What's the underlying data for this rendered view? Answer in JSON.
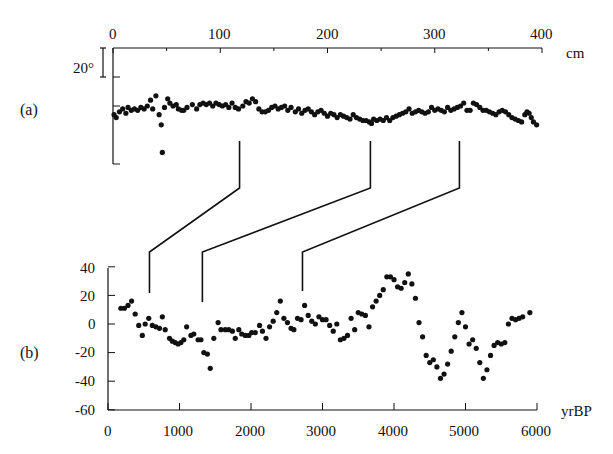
{
  "chart_data": [
    {
      "panel": "(a)",
      "type": "scatter",
      "title": "",
      "xlabel": "cm",
      "ylabel": "",
      "x_axis_position": "top",
      "xlim": [
        0,
        400
      ],
      "x_ticks": [
        0,
        100,
        200,
        300,
        400
      ],
      "scale_bar": "20°",
      "scale_bar_degrees": 20,
      "y_unit": "degrees (relative, unlabeled)",
      "grid": false,
      "points": [
        [
          1,
          -6
        ],
        [
          3,
          -8
        ],
        [
          6,
          -4
        ],
        [
          9,
          -2
        ],
        [
          12,
          -5
        ],
        [
          14,
          -1
        ],
        [
          17,
          -3
        ],
        [
          20,
          -2
        ],
        [
          23,
          -3
        ],
        [
          26,
          -1
        ],
        [
          29,
          -2
        ],
        [
          32,
          0
        ],
        [
          35,
          4
        ],
        [
          37,
          -2
        ],
        [
          40,
          7
        ],
        [
          43,
          -6
        ],
        [
          45,
          -13
        ],
        [
          46,
          -32
        ],
        [
          48,
          -1
        ],
        [
          51,
          5
        ],
        [
          53,
          2
        ],
        [
          56,
          0
        ],
        [
          59,
          1
        ],
        [
          61,
          -2
        ],
        [
          64,
          -3
        ],
        [
          66,
          -3
        ],
        [
          69,
          -1
        ],
        [
          74,
          1
        ],
        [
          78,
          -2
        ],
        [
          81,
          1
        ],
        [
          84,
          2
        ],
        [
          87,
          1
        ],
        [
          90,
          2
        ],
        [
          93,
          0
        ],
        [
          96,
          2
        ],
        [
          99,
          1
        ],
        [
          102,
          0
        ],
        [
          105,
          1
        ],
        [
          108,
          -1
        ],
        [
          111,
          2
        ],
        [
          114,
          -1
        ],
        [
          117,
          -2
        ],
        [
          121,
          0
        ],
        [
          124,
          3
        ],
        [
          127,
          2
        ],
        [
          130,
          5
        ],
        [
          133,
          3
        ],
        [
          136,
          -2
        ],
        [
          139,
          -4
        ],
        [
          142,
          -4
        ],
        [
          145,
          -3
        ],
        [
          148,
          -1
        ],
        [
          151,
          0
        ],
        [
          154,
          -2
        ],
        [
          157,
          -1
        ],
        [
          160,
          0
        ],
        [
          163,
          -3
        ],
        [
          166,
          -1
        ],
        [
          170,
          -4
        ],
        [
          173,
          -2
        ],
        [
          176,
          -5
        ],
        [
          179,
          -3
        ],
        [
          182,
          -2
        ],
        [
          185,
          -4
        ],
        [
          188,
          -6
        ],
        [
          191,
          -4
        ],
        [
          194,
          -3
        ],
        [
          197,
          -5
        ],
        [
          200,
          -7
        ],
        [
          203,
          -5
        ],
        [
          206,
          -6
        ],
        [
          209,
          -8
        ],
        [
          212,
          -6
        ],
        [
          215,
          -7
        ],
        [
          218,
          -8
        ],
        [
          221,
          -9
        ],
        [
          224,
          -6
        ],
        [
          227,
          -8
        ],
        [
          230,
          -9
        ],
        [
          233,
          -10
        ],
        [
          236,
          -10
        ],
        [
          239,
          -11
        ],
        [
          241,
          -12
        ],
        [
          243,
          -9
        ],
        [
          246,
          -10
        ],
        [
          249,
          -9
        ],
        [
          252,
          -10
        ],
        [
          255,
          -8
        ],
        [
          258,
          -10
        ],
        [
          261,
          -8
        ],
        [
          264,
          -7
        ],
        [
          267,
          -6
        ],
        [
          270,
          -5
        ],
        [
          273,
          -4
        ],
        [
          276,
          -2
        ],
        [
          279,
          -5
        ],
        [
          282,
          -4
        ],
        [
          285,
          -3
        ],
        [
          288,
          -4
        ],
        [
          291,
          -5
        ],
        [
          294,
          -4
        ],
        [
          297,
          -1
        ],
        [
          300,
          -3
        ],
        [
          303,
          -2
        ],
        [
          306,
          -3
        ],
        [
          309,
          -4
        ],
        [
          312,
          -1
        ],
        [
          315,
          -3
        ],
        [
          318,
          -2
        ],
        [
          321,
          -1
        ],
        [
          324,
          0
        ],
        [
          327,
          2
        ],
        [
          330,
          -3
        ],
        [
          333,
          -3
        ],
        [
          336,
          2
        ],
        [
          339,
          1
        ],
        [
          342,
          -1
        ],
        [
          345,
          -3
        ],
        [
          348,
          -3
        ],
        [
          351,
          -4
        ],
        [
          354,
          -5
        ],
        [
          357,
          -6
        ],
        [
          360,
          -4
        ],
        [
          363,
          -3
        ],
        [
          366,
          -4
        ],
        [
          369,
          -6
        ],
        [
          372,
          -8
        ],
        [
          375,
          -9
        ],
        [
          378,
          -10
        ],
        [
          381,
          -11
        ],
        [
          384,
          -6
        ],
        [
          386,
          -4
        ],
        [
          388,
          -5
        ],
        [
          390,
          -8
        ],
        [
          392,
          -11
        ],
        [
          395,
          -13
        ]
      ]
    },
    {
      "panel": "(b)",
      "type": "scatter",
      "title": "",
      "xlabel": "yrBP",
      "ylabel": "",
      "x_axis_position": "bottom",
      "xlim": [
        0,
        6000
      ],
      "ylim": [
        -60,
        40
      ],
      "x_ticks": [
        0,
        1000,
        2000,
        3000,
        4000,
        5000,
        6000
      ],
      "y_ticks": [
        40,
        20,
        0,
        -20,
        -40,
        -60
      ],
      "grid": false,
      "points": [
        [
          180,
          11
        ],
        [
          230,
          11
        ],
        [
          280,
          13
        ],
        [
          330,
          16
        ],
        [
          380,
          7
        ],
        [
          430,
          -1
        ],
        [
          480,
          -8
        ],
        [
          520,
          0
        ],
        [
          570,
          4
        ],
        [
          620,
          -1
        ],
        [
          670,
          -2
        ],
        [
          720,
          -3
        ],
        [
          760,
          5
        ],
        [
          800,
          -4
        ],
        [
          860,
          -10
        ],
        [
          900,
          -12
        ],
        [
          940,
          -13
        ],
        [
          980,
          -14
        ],
        [
          1020,
          -13
        ],
        [
          1060,
          -11
        ],
        [
          1100,
          -2
        ],
        [
          1160,
          -8
        ],
        [
          1200,
          -7
        ],
        [
          1260,
          -11
        ],
        [
          1300,
          -11
        ],
        [
          1340,
          -20
        ],
        [
          1390,
          -21
        ],
        [
          1430,
          -31
        ],
        [
          1480,
          -10
        ],
        [
          1540,
          1
        ],
        [
          1580,
          -4
        ],
        [
          1640,
          -4
        ],
        [
          1690,
          -4
        ],
        [
          1740,
          -5
        ],
        [
          1780,
          -10
        ],
        [
          1830,
          -4
        ],
        [
          1870,
          -7
        ],
        [
          1920,
          -8
        ],
        [
          1970,
          -8
        ],
        [
          2010,
          -6
        ],
        [
          2060,
          -6
        ],
        [
          2120,
          -1
        ],
        [
          2160,
          -5
        ],
        [
          2210,
          -10
        ],
        [
          2260,
          -2
        ],
        [
          2310,
          2
        ],
        [
          2360,
          8
        ],
        [
          2410,
          16
        ],
        [
          2460,
          4
        ],
        [
          2510,
          1
        ],
        [
          2560,
          -3
        ],
        [
          2600,
          -4
        ],
        [
          2650,
          4
        ],
        [
          2700,
          3
        ],
        [
          2750,
          13
        ],
        [
          2800,
          6
        ],
        [
          2850,
          2
        ],
        [
          2900,
          0
        ],
        [
          2950,
          5
        ],
        [
          3000,
          3
        ],
        [
          3050,
          3
        ],
        [
          3100,
          -1
        ],
        [
          3150,
          -5
        ],
        [
          3200,
          0
        ],
        [
          3250,
          -11
        ],
        [
          3300,
          -10
        ],
        [
          3350,
          -8
        ],
        [
          3400,
          4
        ],
        [
          3450,
          -4
        ],
        [
          3500,
          8
        ],
        [
          3550,
          7
        ],
        [
          3600,
          6
        ],
        [
          3650,
          -2
        ],
        [
          3700,
          12
        ],
        [
          3750,
          16
        ],
        [
          3800,
          20
        ],
        [
          3850,
          24
        ],
        [
          3900,
          33
        ],
        [
          3950,
          33
        ],
        [
          4000,
          31
        ],
        [
          4050,
          26
        ],
        [
          4100,
          25
        ],
        [
          4150,
          29
        ],
        [
          4200,
          35
        ],
        [
          4250,
          28
        ],
        [
          4300,
          18
        ],
        [
          4350,
          1
        ],
        [
          4400,
          -9
        ],
        [
          4450,
          -22
        ],
        [
          4500,
          -27
        ],
        [
          4550,
          -25
        ],
        [
          4600,
          -30
        ],
        [
          4650,
          -38
        ],
        [
          4700,
          -35
        ],
        [
          4750,
          -28
        ],
        [
          4800,
          -19
        ],
        [
          4850,
          -9
        ],
        [
          4900,
          1
        ],
        [
          4950,
          8
        ],
        [
          5000,
          -2
        ],
        [
          5050,
          -14
        ],
        [
          5100,
          -11
        ],
        [
          5150,
          -17
        ],
        [
          5200,
          -27
        ],
        [
          5250,
          -38
        ],
        [
          5300,
          -32
        ],
        [
          5350,
          -22
        ],
        [
          5400,
          -15
        ],
        [
          5450,
          -13
        ],
        [
          5500,
          -14
        ],
        [
          5550,
          -13
        ],
        [
          5600,
          0
        ],
        [
          5650,
          4
        ],
        [
          5700,
          3
        ],
        [
          5750,
          4
        ],
        [
          5800,
          5
        ],
        [
          5900,
          8
        ]
      ]
    }
  ],
  "correlation_lines": [
    {
      "from_a_cm": 118,
      "to_b_yrBP": 580
    },
    {
      "from_a_cm": 240,
      "to_b_yrBP": 1320
    },
    {
      "from_a_cm": 323,
      "to_b_yrBP": 2720
    }
  ],
  "labels": {
    "panel_a": "(a)",
    "panel_b": "(b)",
    "unit_top": "cm",
    "unit_bottom": "yrBP",
    "scale_bar": "20°",
    "top_ticks": [
      "0",
      "100",
      "200",
      "300",
      "400"
    ],
    "bottom_ticks": [
      "0",
      "1000",
      "2000",
      "3000",
      "4000",
      "5000",
      "6000"
    ],
    "left_ticks_b": [
      "40",
      "20",
      "0",
      "-20",
      "-40",
      "-60"
    ]
  },
  "colors": {
    "ink": "#111111",
    "background": "#ffffff"
  }
}
